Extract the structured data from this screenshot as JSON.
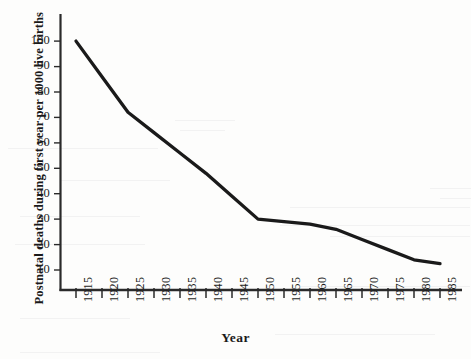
{
  "chart_data": {
    "type": "line",
    "title": "",
    "xlabel": "Year",
    "ylabel": "Postnatal deaths during first year per 1000 live births",
    "x": [
      1915,
      1920,
      1925,
      1930,
      1935,
      1940,
      1945,
      1950,
      1955,
      1960,
      1965,
      1970,
      1975,
      1980,
      1985
    ],
    "values": [
      100,
      86,
      72,
      64,
      56,
      48,
      39,
      30,
      29,
      28,
      26,
      22,
      18,
      14,
      12.5
    ],
    "series": [
      {
        "name": "Postnatal deaths",
        "values": [
          100,
          86,
          72,
          64,
          56,
          48,
          39,
          30,
          29,
          28,
          26,
          22,
          18,
          14,
          12.5
        ]
      }
    ],
    "xtick_labels": [
      "1915",
      "1920",
      "1925",
      "1930",
      "1935",
      "1940",
      "1945",
      "1950",
      "1955",
      "1960",
      "1965",
      "1970",
      "1975",
      "1980",
      "1985"
    ],
    "ytick_labels": [
      "10",
      "20",
      "30",
      "40",
      "50",
      "60",
      "70",
      "80",
      "90",
      "100"
    ],
    "ytick_values": [
      10,
      20,
      30,
      40,
      50,
      60,
      70,
      80,
      90,
      100
    ],
    "xlim": [
      1915,
      1985
    ],
    "ylim": [
      0,
      110
    ],
    "grid": false,
    "legend": "none",
    "line_color": "#1a1a1a",
    "background_color": "#fdfdfc",
    "axis_color": "#2a2a2a"
  },
  "axes": {
    "y_title": "Postnatal deaths during first year per 1000 live births",
    "x_title": "Year"
  }
}
